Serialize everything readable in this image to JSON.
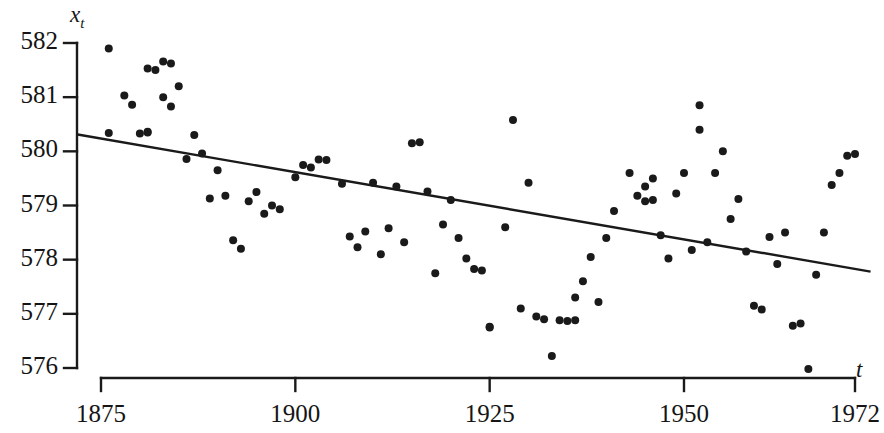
{
  "chart_data": {
    "type": "scatter",
    "title": "",
    "subtitle": "",
    "xlabel": "t",
    "ylabel": "x_t",
    "ylabel_display": "x",
    "ylabel_sub": "t",
    "xlim": [
      1875,
      1972
    ],
    "ylim": [
      576,
      582
    ],
    "grid": false,
    "legend": null,
    "y_ticks": [
      582,
      581,
      580,
      579,
      578,
      577,
      576
    ],
    "x_ticks": [
      1875,
      1900,
      1925,
      1950,
      1972
    ],
    "y_tick_labels": [
      "582",
      "581",
      "580",
      "579",
      "578",
      "577",
      "576"
    ],
    "x_tick_labels": [
      "1875",
      "1900",
      "1925",
      "1950",
      "1972"
    ],
    "marker_color": "#1a1a1a",
    "marker_radius": 4.0,
    "line_color": "#1a1a1a",
    "axis_color": "#1a1a1a",
    "trend_line": {
      "label": "least-squares trend line",
      "x_start": 1872.0,
      "y_start": 580.31,
      "x_end": 1974.0,
      "y_end": 577.78
    },
    "annotations": [],
    "series": [
      {
        "name": "x_t",
        "points": [
          [
            1876,
            581.9
          ],
          [
            1876,
            580.34
          ],
          [
            1878,
            581.03
          ],
          [
            1879,
            580.86
          ],
          [
            1880,
            580.33
          ],
          [
            1881,
            580.36
          ],
          [
            1881,
            580.35
          ],
          [
            1881,
            581.53
          ],
          [
            1882,
            581.5
          ],
          [
            1883,
            581.66
          ],
          [
            1883,
            581.0
          ],
          [
            1884,
            581.62
          ],
          [
            1884,
            580.83
          ],
          [
            1885,
            581.2
          ],
          [
            1886,
            579.86
          ],
          [
            1887,
            580.3
          ],
          [
            1888,
            579.96
          ],
          [
            1889,
            579.13
          ],
          [
            1890,
            579.65
          ],
          [
            1891,
            579.18
          ],
          [
            1892,
            578.36
          ],
          [
            1893,
            578.2
          ],
          [
            1894,
            579.08
          ],
          [
            1895,
            579.25
          ],
          [
            1896,
            578.85
          ],
          [
            1897,
            579.0
          ],
          [
            1898,
            578.93
          ],
          [
            1900,
            579.52
          ],
          [
            1901,
            579.75
          ],
          [
            1902,
            579.7
          ],
          [
            1903,
            579.85
          ],
          [
            1904,
            579.84
          ],
          [
            1906,
            579.4
          ],
          [
            1907,
            578.43
          ],
          [
            1908,
            578.23
          ],
          [
            1909,
            578.52
          ],
          [
            1910,
            579.42
          ],
          [
            1911,
            578.1
          ],
          [
            1912,
            578.58
          ],
          [
            1913,
            579.35
          ],
          [
            1914,
            578.32
          ],
          [
            1915,
            580.15
          ],
          [
            1916,
            580.17
          ],
          [
            1917,
            579.26
          ],
          [
            1918,
            577.75
          ],
          [
            1919,
            578.65
          ],
          [
            1920,
            579.1
          ],
          [
            1921,
            578.4
          ],
          [
            1922,
            578.02
          ],
          [
            1923,
            577.83
          ],
          [
            1924,
            577.8
          ],
          [
            1925,
            576.76
          ],
          [
            1925,
            576.75
          ],
          [
            1927,
            578.6
          ],
          [
            1928,
            580.58
          ],
          [
            1929,
            577.1
          ],
          [
            1930,
            579.42
          ],
          [
            1931,
            576.95
          ],
          [
            1932,
            576.9
          ],
          [
            1933,
            576.22
          ],
          [
            1934,
            576.88
          ],
          [
            1935,
            576.87
          ],
          [
            1936,
            577.3
          ],
          [
            1936,
            576.88
          ],
          [
            1937,
            577.6
          ],
          [
            1938,
            578.05
          ],
          [
            1939,
            577.22
          ],
          [
            1940,
            578.4
          ],
          [
            1941,
            578.9
          ],
          [
            1943,
            579.6
          ],
          [
            1944,
            579.18
          ],
          [
            1945,
            579.35
          ],
          [
            1945,
            579.08
          ],
          [
            1946,
            579.5
          ],
          [
            1946,
            579.1
          ],
          [
            1947,
            578.45
          ],
          [
            1948,
            578.02
          ],
          [
            1949,
            579.22
          ],
          [
            1950,
            579.6
          ],
          [
            1951,
            578.18
          ],
          [
            1952,
            580.85
          ],
          [
            1952,
            580.4
          ],
          [
            1953,
            578.32
          ],
          [
            1954,
            579.6
          ],
          [
            1955,
            580.0
          ],
          [
            1956,
            578.75
          ],
          [
            1957,
            579.12
          ],
          [
            1958,
            578.15
          ],
          [
            1959,
            577.15
          ],
          [
            1960,
            577.08
          ],
          [
            1961,
            578.42
          ],
          [
            1962,
            577.92
          ],
          [
            1963,
            578.5
          ],
          [
            1964,
            576.78
          ],
          [
            1965,
            576.82
          ],
          [
            1966,
            575.98
          ],
          [
            1967,
            577.72
          ],
          [
            1968,
            578.5
          ],
          [
            1969,
            579.38
          ],
          [
            1970,
            579.6
          ],
          [
            1971,
            579.92
          ],
          [
            1972,
            579.95
          ]
        ]
      }
    ]
  }
}
